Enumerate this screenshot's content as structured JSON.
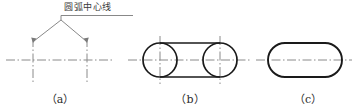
{
  "figure": {
    "title_text": "圆弧中心线",
    "width": 356,
    "height": 112,
    "background_color": "#ffffff",
    "outline_color": "#1a1a1a",
    "centerline_color": "#8a8a8a",
    "leader_color": "#7a7a7a",
    "text_color": "#3a3a3a",
    "caption_color": "#2b2b2b"
  },
  "annotation": {
    "label": "圆弧中心线",
    "leader_apex_x": 61,
    "leader_apex_y": 20,
    "underline_from_x": 64,
    "underline_to_x": 133,
    "underline_y": 15
  },
  "captions": {
    "a": "（a）",
    "b": "（b）",
    "c": "（c）"
  },
  "panels": [
    {
      "key": "a",
      "caption": "（a）",
      "description": "arc center lines only",
      "horizontal_centerline": {
        "x1": 6,
        "x2": 114,
        "y": 60
      },
      "vertical_centerlines": [
        {
          "x": 33,
          "y1": 38,
          "y2": 82
        },
        {
          "x": 87,
          "y1": 38,
          "y2": 82
        }
      ],
      "leader_targets": [
        {
          "x": 33,
          "y": 40
        },
        {
          "x": 87,
          "y": 40
        }
      ]
    },
    {
      "key": "b",
      "caption": "（b）",
      "description": "full circles plus tangent lines",
      "horizontal_centerline": {
        "x1": 128,
        "x2": 250,
        "y": 60
      },
      "vertical_centerlines": [
        {
          "x": 160,
          "y1": 36,
          "y2": 84
        },
        {
          "x": 220,
          "y1": 36,
          "y2": 84
        }
      ],
      "circles": [
        {
          "cx": 160,
          "cy": 60,
          "r": 17
        },
        {
          "cx": 220,
          "cy": 60,
          "r": 17
        }
      ],
      "tangent_lines": [
        {
          "x1": 160,
          "y1": 43,
          "x2": 220,
          "y2": 43
        },
        {
          "x1": 160,
          "y1": 77,
          "x2": 220,
          "y2": 77
        }
      ]
    },
    {
      "key": "c",
      "caption": "（c）",
      "description": "finished obround slot outline",
      "horizontal_centerline": {
        "x1": 256,
        "x2": 350,
        "y": 60
      },
      "slot": {
        "x": 268,
        "y": 43,
        "width": 74,
        "height": 34,
        "radius": 17
      }
    }
  ]
}
